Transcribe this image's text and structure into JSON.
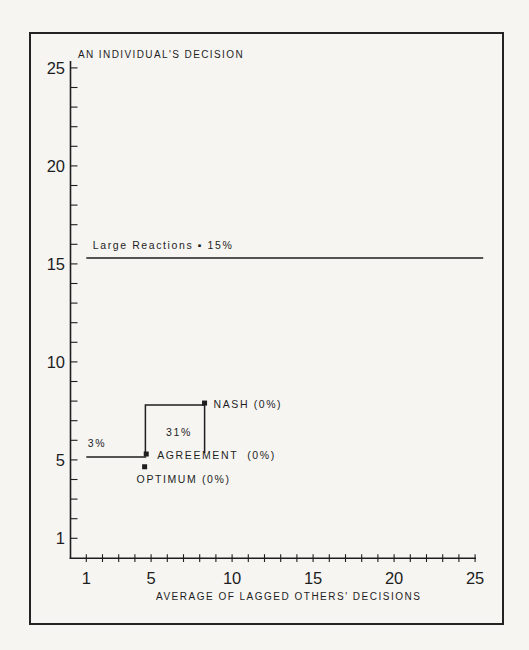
{
  "figure": {
    "background": "#f6f5f2",
    "ink": "#1e1e1e",
    "border_color": "#232323"
  },
  "chart_data": {
    "type": "scatter",
    "title": "AN INDIVIDUAL'S DECISION",
    "xlabel": "AVERAGE OF LAGGED OTHERS' DECISIONS",
    "ylabel": "",
    "xlim": [
      0,
      25.6
    ],
    "ylim": [
      0,
      25.6
    ],
    "x_tick_labels": [
      1,
      5,
      10,
      15,
      20,
      25
    ],
    "y_tick_labels": [
      1,
      5,
      10,
      15,
      20,
      25
    ],
    "minor_tick_step": 1,
    "grid": false,
    "legend": "none",
    "points": [
      {
        "name": "nash",
        "label": "NASH (0%)",
        "x": 8.3,
        "y": 7.9
      },
      {
        "name": "agreement",
        "label": "AGREEMENT  (0%)",
        "x": 4.7,
        "y": 5.3
      },
      {
        "name": "optimum",
        "label": "OPTIMUM (0%)",
        "x": 4.6,
        "y": 4.65
      }
    ],
    "lines": [
      {
        "name": "large-reactions-line",
        "points": [
          [
            1,
            15.3
          ],
          [
            25.5,
            15.3
          ]
        ]
      },
      {
        "name": "agreement-reaction-line",
        "points": [
          [
            1,
            5.15
          ],
          [
            4.7,
            5.15
          ]
        ]
      },
      {
        "name": "best-response-step",
        "points": [
          [
            4.65,
            5.3
          ],
          [
            4.65,
            7.8
          ],
          [
            8.3,
            7.8
          ],
          [
            8.3,
            5.35
          ]
        ]
      }
    ],
    "annotations": [
      {
        "name": "large-reactions-label",
        "text": "Large Reactions ▪ 15%",
        "x": 1.4,
        "y": 15.75,
        "align": "start"
      },
      {
        "name": "pct-3-label",
        "text": "3%",
        "x": 1.66,
        "y": 5.66,
        "align": "middle"
      },
      {
        "name": "pct-31-label",
        "text": "31%",
        "x": 6.72,
        "y": 6.22,
        "align": "middle"
      }
    ]
  }
}
